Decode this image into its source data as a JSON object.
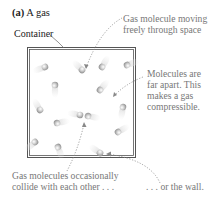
{
  "figure": {
    "panel_label": "(a)",
    "title": "A gas",
    "container_label": "Container",
    "annotations": {
      "moving": [
        "Gas molecule moving",
        "freely through space"
      ],
      "far_apart": [
        "Molecules are",
        "far apart. This",
        "makes a gas",
        "compressible."
      ],
      "collide": [
        "Gas molecules occasionally",
        "collide with each other . . ."
      ],
      "wall": ". . . or the wall."
    },
    "colors": {
      "container_border": "#555555",
      "molecule": "#bdbdbd",
      "annotation_text": "#777777",
      "arrow": "#888888"
    }
  }
}
